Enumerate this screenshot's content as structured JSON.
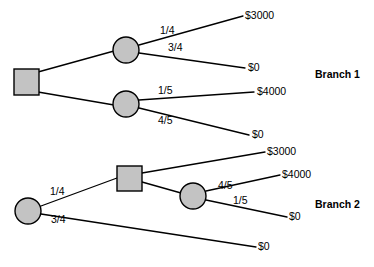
{
  "diagram": {
    "colors": {
      "node_fill": "#c3c3c3",
      "stroke": "#000000",
      "background": "#ffffff"
    },
    "branch1": {
      "label": "Branch 1",
      "root": {
        "type": "decision-square"
      },
      "chance_node_top": {
        "probabilities": [
          "1/4",
          "3/4"
        ],
        "payoffs": [
          "$3000",
          "$0"
        ]
      },
      "chance_node_bottom": {
        "probabilities": [
          "1/5",
          "4/5"
        ],
        "payoffs": [
          "$4000",
          "$0"
        ]
      }
    },
    "branch2": {
      "label": "Branch 2",
      "root": {
        "type": "chance-circle"
      },
      "root_probabilities": [
        "1/4",
        "3/4"
      ],
      "root_lower_payoff": "$0",
      "decision_node": {
        "type": "decision-square",
        "upper_payoff": "$3000"
      },
      "chance_node": {
        "probabilities": [
          "4/5",
          "1/5"
        ],
        "payoffs": [
          "$4000",
          "$0"
        ]
      }
    }
  }
}
